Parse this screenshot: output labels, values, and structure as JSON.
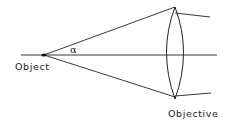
{
  "diagram": {
    "type": "optics-ray-diagram",
    "labels": {
      "object": "Object",
      "objective": "Objective",
      "angle": "α"
    },
    "colors": {
      "line": "#222222",
      "background": "#ffffff"
    }
  }
}
